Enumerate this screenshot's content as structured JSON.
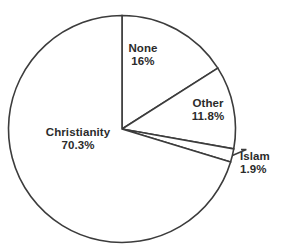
{
  "chart_data": {
    "type": "pie",
    "title": "",
    "subtitle": "",
    "xlabel": "",
    "ylabel": "",
    "legend_position": "none",
    "grid": false,
    "start_angle_deg": 0,
    "direction": "clockwise",
    "units": "percent",
    "categories": [
      "None",
      "Other",
      "Islam",
      "Christianity"
    ],
    "values": [
      16,
      11.8,
      1.9,
      70.3
    ],
    "slices": [
      {
        "name": "None",
        "value": 16,
        "value_label": "16%",
        "start_deg": 0,
        "end_deg": 57.6,
        "fill": "#ffffff",
        "stroke": "#3c3c3c",
        "label_placement": "inside",
        "leader_line": false
      },
      {
        "name": "Other",
        "value": 11.8,
        "value_label": "11.8%",
        "start_deg": 57.6,
        "end_deg": 100.08,
        "fill": "#ffffff",
        "stroke": "#3c3c3c",
        "label_placement": "inside",
        "leader_line": false
      },
      {
        "name": "Islam",
        "value": 1.9,
        "value_label": "1.9%",
        "start_deg": 100.08,
        "end_deg": 106.92,
        "fill": "#ffffff",
        "stroke": "#3c3c3c",
        "label_placement": "outside",
        "leader_line": true
      },
      {
        "name": "Christianity",
        "value": 70.3,
        "value_label": "70.3%",
        "start_deg": 106.92,
        "end_deg": 360,
        "fill": "#ffffff",
        "stroke": "#3c3c3c",
        "label_placement": "inside",
        "leader_line": false
      }
    ]
  },
  "labels": {
    "christianity": {
      "name": "Christianity",
      "value": "70.3%"
    },
    "none": {
      "name": "None",
      "value": "16%"
    },
    "other": {
      "name": "Other",
      "value": "11.8%"
    },
    "islam": {
      "name": "Islam",
      "value": "1.9%"
    }
  },
  "colors": {
    "background": "#ffffff",
    "slice_fill": "#ffffff",
    "outline": "#3c3c3c",
    "text": "#2b2b2b"
  }
}
